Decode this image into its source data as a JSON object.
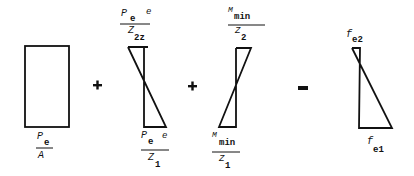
{
  "diagram": {
    "type": "stress-superposition",
    "terms": [
      {
        "id": "axial",
        "shape": "rectangle",
        "bottom_label": {
          "num_main": "P",
          "num_sub": "e",
          "den_main": "A"
        }
      },
      {
        "operator": "+"
      },
      {
        "id": "prestress-moment",
        "shape": "hourglass",
        "top_label": {
          "num_main": "P",
          "num_sub": "e",
          "num_extra": "e",
          "den_main": "Z",
          "den_sub": "2z"
        },
        "bottom_label": {
          "num_main": "P",
          "num_sub": "e",
          "num_extra": "e",
          "den_main": "Z",
          "den_sub": "1"
        }
      },
      {
        "operator": "+"
      },
      {
        "id": "min-moment",
        "shape": "hourglass-reversed",
        "top_label": {
          "num_main": "M",
          "num_sub": "min",
          "den_main": "Z",
          "den_sub": "2"
        },
        "bottom_label": {
          "num_main": "M",
          "num_sub": "min",
          "den_main": "Z",
          "den_sub": "1"
        }
      },
      {
        "operator": "="
      },
      {
        "id": "result",
        "shape": "resultant-triangle",
        "top_label": {
          "main": "f",
          "sub": "e2"
        },
        "bottom_label": {
          "main": "f",
          "sub": "e1"
        }
      }
    ],
    "colors": {
      "ink": "#111111",
      "background": "#ffffff"
    }
  }
}
